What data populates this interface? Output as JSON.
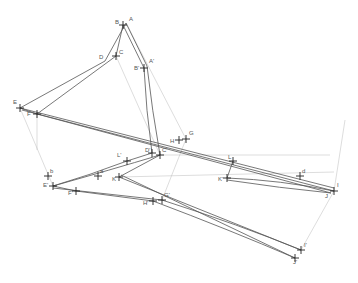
{
  "diagram": {
    "type": "projective line drawing",
    "points": [
      {
        "id": "A",
        "label": "A",
        "x": 126,
        "y": 23,
        "lx": 129,
        "ly": 21
      },
      {
        "id": "B",
        "label": "B",
        "x": 123,
        "y": 25,
        "lx": 115,
        "ly": 24
      },
      {
        "id": "Ap",
        "label": "A'",
        "x": 147,
        "y": 66,
        "lx": 149,
        "ly": 63
      },
      {
        "id": "Bp",
        "label": "B'",
        "x": 144,
        "y": 68,
        "lx": 134,
        "ly": 70
      },
      {
        "id": "C",
        "label": "C",
        "x": 116,
        "y": 56,
        "lx": 119,
        "ly": 54
      },
      {
        "id": "D",
        "label": "D",
        "x": 105,
        "y": 61,
        "lx": 99,
        "ly": 59
      },
      {
        "id": "E",
        "label": "E",
        "x": 20,
        "y": 108,
        "lx": 13,
        "ly": 104
      },
      {
        "id": "F",
        "label": "F",
        "x": 37,
        "y": 114,
        "lx": 27,
        "ly": 116
      },
      {
        "id": "G",
        "label": "G",
        "x": 186,
        "y": 139,
        "lx": 189,
        "ly": 135
      },
      {
        "id": "H",
        "label": "H",
        "x": 179,
        "y": 140,
        "lx": 170,
        "ly": 143
      },
      {
        "id": "Dp",
        "label": "D'",
        "x": 152,
        "y": 153,
        "lx": 145,
        "ly": 152
      },
      {
        "id": "Cp",
        "label": "C'",
        "x": 160,
        "y": 155,
        "lx": 162,
        "ly": 152
      },
      {
        "id": "Lp",
        "label": "L'",
        "x": 127,
        "y": 161,
        "lx": 117,
        "ly": 157
      },
      {
        "id": "L",
        "label": "L",
        "x": 233,
        "y": 161,
        "lx": 228,
        "ly": 159
      },
      {
        "id": "Kp",
        "label": "K'",
        "x": 227,
        "y": 178,
        "lx": 218,
        "ly": 181
      },
      {
        "id": "K",
        "label": "K",
        "x": 119,
        "y": 177,
        "lx": 112,
        "ly": 181
      },
      {
        "id": "a",
        "label": "a",
        "x": 98,
        "y": 176,
        "lx": 100,
        "ly": 173
      },
      {
        "id": "b",
        "label": "b",
        "x": 48,
        "y": 176,
        "lx": 50,
        "ly": 173
      },
      {
        "id": "Ep",
        "label": "E'",
        "x": 53,
        "y": 186,
        "lx": 43,
        "ly": 187
      },
      {
        "id": "Fp",
        "label": "F'",
        "x": 76,
        "y": 191,
        "lx": 68,
        "ly": 195
      },
      {
        "id": "Hp",
        "label": "H'",
        "x": 153,
        "y": 201,
        "lx": 143,
        "ly": 205
      },
      {
        "id": "Gp",
        "label": "G'",
        "x": 162,
        "y": 200,
        "lx": 164,
        "ly": 197
      },
      {
        "id": "d",
        "label": "d",
        "x": 300,
        "y": 176,
        "lx": 302,
        "ly": 173
      },
      {
        "id": "I",
        "label": "I",
        "x": 334,
        "y": 191,
        "lx": 337,
        "ly": 187
      },
      {
        "id": "J",
        "label": "J",
        "x": 331,
        "y": 193,
        "lx": 325,
        "ly": 198
      },
      {
        "id": "Ip",
        "label": "I'",
        "x": 301,
        "y": 250,
        "lx": 304,
        "ly": 247
      },
      {
        "id": "Jp",
        "label": "J'",
        "x": 295,
        "y": 258,
        "lx": 293,
        "ly": 264
      }
    ]
  }
}
